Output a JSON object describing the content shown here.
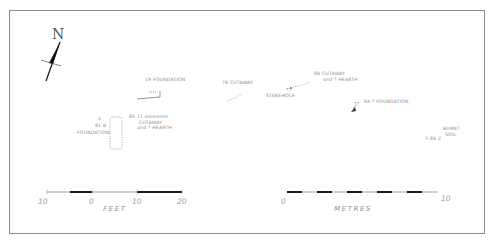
{
  "diagram": {
    "type": "archaeological-site-plan",
    "north_label": "N",
    "features": [
      {
        "id": "f19",
        "number": "19",
        "label": "FOUNDATION"
      },
      {
        "id": "f76",
        "number": "76",
        "label": "CUTAWAY"
      },
      {
        "id": "f80",
        "number": "80",
        "label_line1": "CUTAWAY",
        "label_line2": "and ? HEARTH"
      },
      {
        "id": "f64",
        "number": "64",
        "label": "? FOUNDATION"
      },
      {
        "id": "f81",
        "number": "81 B",
        "label": "FOUNDATION",
        "marker": "A"
      },
      {
        "id": "f85",
        "number": "85",
        "label_line1": "11 elements",
        "label_line2": "CUTAWAY",
        "label_line3": "and ? HEARTH"
      },
      {
        "id": "f77",
        "number": "77",
        "label": "STAKEHOLE"
      },
      {
        "id": "f84",
        "number": "84 Z",
        "label_line1": "BURNT",
        "label_line2": "SOIL"
      }
    ],
    "point_label_64": "77"
  },
  "scales": {
    "feet": {
      "unit": "FEET",
      "ticks": [
        "10",
        "0",
        "10",
        "20"
      ]
    },
    "metres": {
      "unit": "METRES",
      "ticks": [
        "0",
        "10"
      ]
    }
  },
  "colors": {
    "frame": "#8c8c8c",
    "ink": "#222222",
    "faint_ink": "#9a9a9a"
  }
}
